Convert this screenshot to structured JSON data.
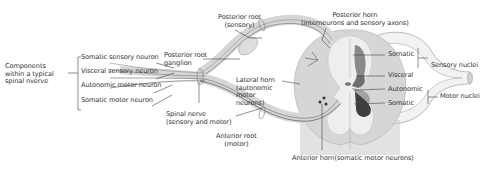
{
  "diagram": {
    "components_group": {
      "label_line1": "Components",
      "label_line2": "within a typical",
      "label_line3": "spinal nverve",
      "items": [
        {
          "label": "Somatic sensory neuron"
        },
        {
          "label": "Visceral sensory neuron"
        },
        {
          "label": "Autonomic motor neuron"
        },
        {
          "label": "Somatic motor neuron"
        }
      ]
    },
    "labels": {
      "posterior_root_ganglion_1": "Posterior root",
      "posterior_root_ganglion_2": "ganglion",
      "posterior_root_sensory_1": "Posterior root",
      "posterior_root_sensory_2": "(sensory)",
      "posterior_horn_1": "Posterior horn",
      "posterior_horn_2": "(interneurons and sensory axons)",
      "lateral_horn_1": "Lateral horn",
      "lateral_horn_2": "(autonomic",
      "lateral_horn_3": "motor",
      "lateral_horn_4": "neurons)",
      "spinal_nerve_1": "Spinal nerve",
      "spinal_nerve_2": "(sensory and motor)",
      "anterior_root_1": "Anterior root",
      "anterior_root_2": "(motor)",
      "anterior_horn": "Anterior horn(somatic motor neurons)",
      "somatic_top": "Somatic",
      "visceral": "Visceral",
      "autonomic": "Autonomic",
      "somatic_bottom": "Somatic",
      "sensory_nuclei": "Sensory nuclei",
      "motor_nuclei": "Motor nuclei"
    },
    "colors": {
      "white_matter": "#d9d9d9",
      "gray_matter": "#eeeeee",
      "somatic_sensory": "#8a8a8a",
      "visceral_sensory": "#6e6e6e",
      "autonomic": "#a3a3a3",
      "somatic_motor": "#3e3e3e",
      "nerve": "#e2e2e2",
      "line": "#444444"
    }
  }
}
